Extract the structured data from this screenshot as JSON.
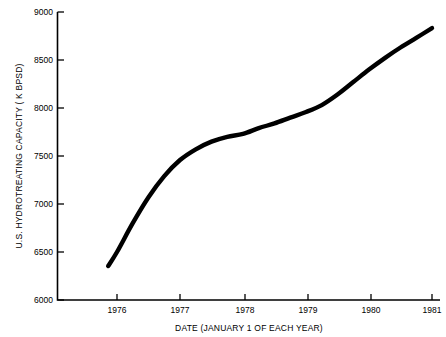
{
  "chart_data": {
    "type": "line",
    "title": "",
    "subtitle": "",
    "xlabel": "DATE (JANUARY 1 OF EACH YEAR)",
    "ylabel": "U.S. HYDROTREATING CAPACITY  ( K BPSD)",
    "xlim": [
      1975.7,
      1981
    ],
    "ylim": [
      6000,
      9000
    ],
    "grid": false,
    "legend": null,
    "legend_position": "none",
    "x_tick_labels": [
      "1976",
      "1977",
      "1978",
      "1979",
      "1980",
      "1981"
    ],
    "x_tick_values": [
      1976,
      1977,
      1978,
      1979,
      1980,
      1981
    ],
    "y_tick_labels": [
      "6000",
      "6500",
      "7000",
      "7500",
      "8000",
      "8500",
      "9000"
    ],
    "y_tick_values": [
      6000,
      6500,
      7000,
      7500,
      8000,
      8500,
      9000
    ],
    "series": [
      {
        "name": "U.S. Hydrotreating Capacity",
        "color": "#000000",
        "x": [
          1975.86,
          1976.0,
          1976.25,
          1976.5,
          1976.75,
          1977.0,
          1977.25,
          1977.5,
          1977.75,
          1978.0,
          1978.25,
          1978.5,
          1978.75,
          1979.0,
          1979.25,
          1979.5,
          1979.75,
          1980.0,
          1980.25,
          1980.5,
          1980.75,
          1981.0
        ],
        "values": [
          6354,
          6500,
          6800,
          7070,
          7290,
          7458,
          7570,
          7650,
          7700,
          7730,
          7790,
          7840,
          7900,
          7958,
          8030,
          8140,
          8270,
          8400,
          8520,
          8630,
          8730,
          8833
        ]
      }
    ],
    "annotations": []
  },
  "colors": {
    "background": "#ffffff",
    "axis": "#000000",
    "curve": "#000000",
    "text": "#000000"
  }
}
